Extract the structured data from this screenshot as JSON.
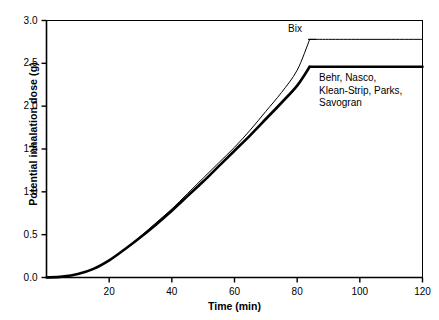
{
  "chart_data": {
    "type": "line",
    "title": "",
    "xlabel": "Time (min)",
    "ylabel": "Potential inhalation dose (g)",
    "xlim": [
      0,
      120
    ],
    "ylim": [
      0,
      3.0
    ],
    "xticks": [
      0,
      20,
      40,
      60,
      80,
      100,
      120
    ],
    "xticklabels": [
      "",
      "20",
      "40",
      "60",
      "80",
      "100",
      "120"
    ],
    "yticks": [
      0.0,
      0.5,
      1.0,
      1.5,
      2.0,
      2.5,
      3.0
    ],
    "yticklabels": [
      "0.0",
      "0.5",
      "1.0",
      "1.5",
      "2.0",
      "2.5",
      "3.0"
    ],
    "grid": false,
    "legend_position": "inline-annotation",
    "series": [
      {
        "name": "Bix",
        "linewidth": "thin",
        "color": "#000000",
        "plateau_value": 2.78,
        "plateau_start_min": 84,
        "x": [
          0,
          5,
          10,
          15,
          20,
          25,
          30,
          35,
          40,
          45,
          50,
          55,
          60,
          65,
          70,
          75,
          80,
          84,
          90,
          100,
          110,
          120
        ],
        "y": [
          0.0,
          0.01,
          0.04,
          0.1,
          0.2,
          0.33,
          0.48,
          0.64,
          0.8,
          0.98,
          1.16,
          1.34,
          1.52,
          1.72,
          1.94,
          2.16,
          2.42,
          2.78,
          2.78,
          2.78,
          2.78,
          2.78
        ]
      },
      {
        "name": "Behr, Nasco, Klean-Strip, Parks, Savogran",
        "linewidth": "thick",
        "color": "#000000",
        "plateau_value": 2.46,
        "plateau_start_min": 84,
        "x": [
          0,
          5,
          10,
          15,
          20,
          25,
          30,
          35,
          40,
          45,
          50,
          55,
          60,
          65,
          70,
          75,
          80,
          84,
          90,
          100,
          110,
          120
        ],
        "y": [
          0.0,
          0.01,
          0.04,
          0.1,
          0.2,
          0.33,
          0.47,
          0.62,
          0.78,
          0.95,
          1.12,
          1.3,
          1.48,
          1.66,
          1.85,
          2.04,
          2.24,
          2.46,
          2.46,
          2.46,
          2.46,
          2.46
        ]
      }
    ],
    "annotations": [
      {
        "id": "bix",
        "text": "Bix"
      },
      {
        "id": "group",
        "text": "Behr, Nasco,\nKlean-Strip, Parks,\nSavogran"
      }
    ]
  }
}
